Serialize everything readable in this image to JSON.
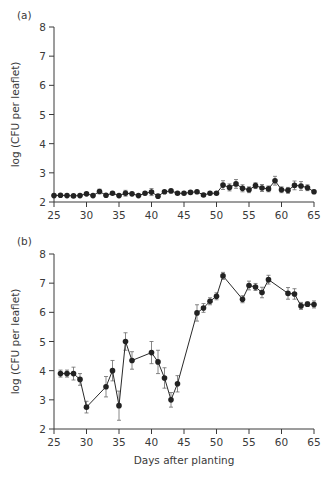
{
  "chart_data": [
    {
      "type": "line",
      "panel_label": "(a)",
      "title": "",
      "xlabel": "",
      "ylabel": "log (CFU per leaflet)",
      "xlim": [
        25,
        65
      ],
      "ylim": [
        2,
        8
      ],
      "x_ticks": [
        25,
        30,
        35,
        40,
        45,
        50,
        55,
        60,
        65
      ],
      "y_ticks": [
        2,
        3,
        4,
        5,
        6,
        7,
        8
      ],
      "grid": false,
      "legend": null,
      "series": [
        {
          "name": "panel a",
          "x": [
            25,
            26,
            27,
            28,
            29,
            30,
            31,
            32,
            33,
            34,
            35,
            36,
            37,
            38,
            39,
            40,
            41,
            42,
            43,
            44,
            45,
            46,
            47,
            48,
            49,
            50,
            51,
            52,
            53,
            54,
            55,
            56,
            57,
            58,
            59,
            60,
            61,
            62,
            63,
            64,
            65
          ],
          "values": [
            2.22,
            2.23,
            2.22,
            2.21,
            2.22,
            2.28,
            2.22,
            2.36,
            2.23,
            2.3,
            2.22,
            2.3,
            2.28,
            2.22,
            2.3,
            2.34,
            2.2,
            2.35,
            2.38,
            2.3,
            2.3,
            2.33,
            2.35,
            2.24,
            2.3,
            2.3,
            2.58,
            2.5,
            2.62,
            2.47,
            2.42,
            2.56,
            2.48,
            2.45,
            2.73,
            2.42,
            2.4,
            2.57,
            2.55,
            2.49,
            2.35
          ],
          "errors": [
            0.03,
            0.03,
            0.03,
            0.03,
            0.03,
            0.05,
            0.03,
            0.08,
            0.04,
            0.04,
            0.04,
            0.1,
            0.04,
            0.03,
            0.05,
            0.12,
            0.04,
            0.04,
            0.05,
            0.04,
            0.04,
            0.04,
            0.04,
            0.04,
            0.04,
            0.04,
            0.15,
            0.12,
            0.15,
            0.12,
            0.1,
            0.1,
            0.12,
            0.1,
            0.15,
            0.1,
            0.1,
            0.15,
            0.15,
            0.1,
            0.05
          ]
        }
      ]
    },
    {
      "type": "line",
      "panel_label": "(b)",
      "title": "",
      "xlabel": "Days after planting",
      "ylabel": "log (CFU per leaflet)",
      "xlim": [
        25,
        65
      ],
      "ylim": [
        2,
        8
      ],
      "x_ticks": [
        25,
        30,
        35,
        40,
        45,
        50,
        55,
        60,
        65
      ],
      "y_ticks": [
        2,
        3,
        4,
        5,
        6,
        7,
        8
      ],
      "grid": false,
      "legend": null,
      "series": [
        {
          "name": "panel b",
          "x": [
            26,
            27,
            28,
            29,
            30,
            33,
            34,
            35,
            36,
            37,
            40,
            41,
            42,
            43,
            44,
            47,
            48,
            49,
            50,
            51,
            54,
            55,
            56,
            57,
            58,
            61,
            62,
            63,
            64,
            65
          ],
          "values": [
            3.9,
            3.9,
            3.9,
            3.7,
            2.75,
            3.45,
            4.0,
            2.8,
            5.0,
            4.35,
            4.62,
            4.3,
            3.75,
            3.0,
            3.55,
            5.98,
            6.15,
            6.38,
            6.55,
            7.25,
            6.45,
            6.92,
            6.87,
            6.68,
            7.12,
            6.65,
            6.63,
            6.22,
            6.28,
            6.27
          ],
          "errors": [
            0.12,
            0.12,
            0.22,
            0.2,
            0.2,
            0.35,
            0.35,
            0.5,
            0.3,
            0.3,
            0.38,
            0.4,
            0.35,
            0.25,
            0.28,
            0.28,
            0.15,
            0.12,
            0.12,
            0.12,
            0.12,
            0.15,
            0.12,
            0.18,
            0.15,
            0.2,
            0.18,
            0.12,
            0.08,
            0.12
          ]
        }
      ]
    }
  ],
  "panels": {
    "a": {
      "label": "(a)",
      "ylabel": "log (CFU per leaflet)"
    },
    "b": {
      "label": "(b)",
      "ylabel": "log (CFU per leaflet)",
      "xlabel": "Days after planting"
    }
  }
}
